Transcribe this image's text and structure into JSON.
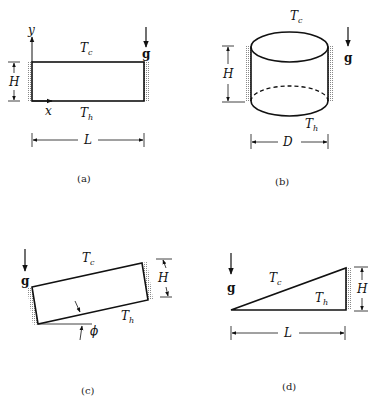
{
  "panels": {
    "a": {
      "caption": "(a)",
      "label_y": "y",
      "label_x": "x",
      "top_temp": "T",
      "top_temp_sub": "c",
      "bottom_temp": "T",
      "bottom_temp_sub": "h",
      "gravity": "g",
      "height": "H",
      "length": "L"
    },
    "b": {
      "caption": "(b)",
      "top_temp": "T",
      "top_temp_sub": "c",
      "bottom_temp": "T",
      "bottom_temp_sub": "h",
      "gravity": "g",
      "height": "H",
      "diameter": "D"
    },
    "c": {
      "caption": "(c)",
      "top_temp": "T",
      "top_temp_sub": "c",
      "bottom_temp": "T",
      "bottom_temp_sub": "h",
      "gravity": "g",
      "height": "H",
      "angle": "ϕ"
    },
    "d": {
      "caption": "(d)",
      "top_temp": "T",
      "top_temp_sub": "c",
      "bottom_temp": "T",
      "bottom_temp_sub": "h",
      "gravity": "g",
      "height": "H",
      "length": "L"
    }
  }
}
